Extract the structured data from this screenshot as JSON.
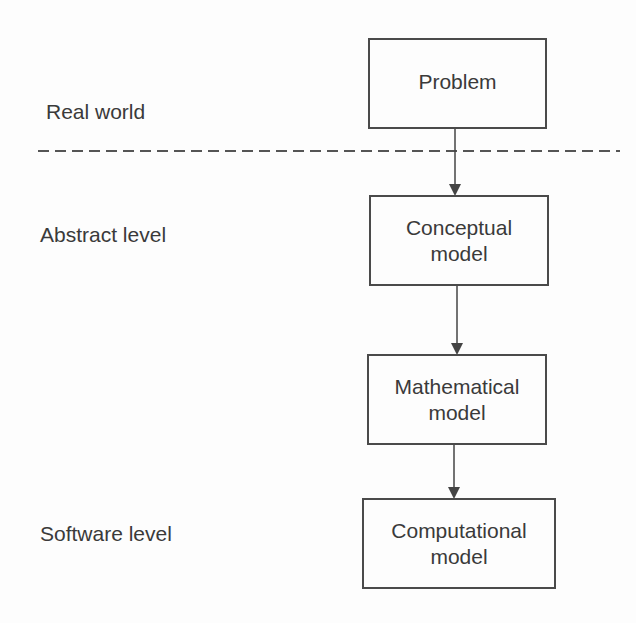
{
  "levels": [
    {
      "label": "Real world"
    },
    {
      "label": "Abstract level"
    },
    {
      "label": "Software level"
    }
  ],
  "boxes": [
    {
      "line1": "Problem",
      "line2": ""
    },
    {
      "line1": "Conceptual",
      "line2": "model"
    },
    {
      "line1": "Mathematical",
      "line2": "model"
    },
    {
      "line1": "Computational",
      "line2": "model"
    }
  ],
  "style": {
    "stroke": "#4a4a4a",
    "text": "#3a3a3a",
    "background": "#fdfdfd"
  }
}
